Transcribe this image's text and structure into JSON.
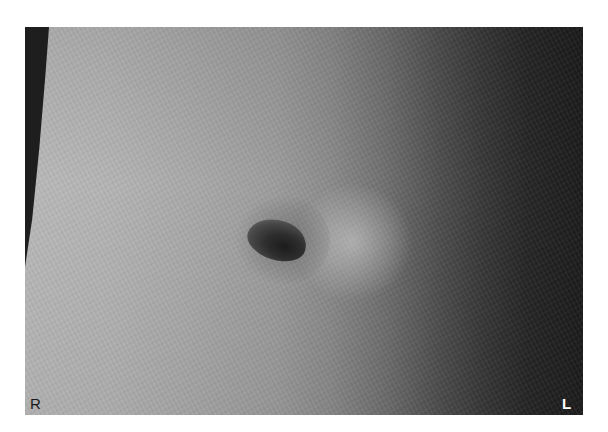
{
  "image": {
    "description": "Grayscale clinical photograph of an abdomen showing the umbilicus",
    "background_color": "#ffffff",
    "tones": {
      "left_skin": "#b9b9b9",
      "center_skin": "#9c9c9c",
      "right_shadow": "#1c1c1c",
      "navel": "#1c1c1c",
      "body_edge": "#1e1e1e"
    }
  },
  "orientation_labels": {
    "right": "R",
    "left": "L"
  }
}
